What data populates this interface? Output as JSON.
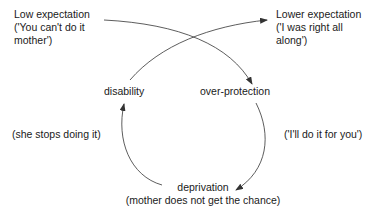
{
  "nodes": {
    "low_expectation": {
      "title": "Low expectation",
      "line2": "('You can't do it",
      "line3": "mother')"
    },
    "lower_expectation": {
      "title": "Lower expectation",
      "line2": "('I was right all",
      "line3": "along')"
    },
    "disability": {
      "label": "disability"
    },
    "over_protection": {
      "label": "over-protection"
    },
    "deprivation": {
      "label": "deprivation",
      "sub": "(mother does not get the chance)"
    }
  },
  "annotations": {
    "left": "(she stops doing it)",
    "right": "('I'll do it for you')"
  },
  "edges": [
    {
      "from": "low_expectation",
      "to": "over_protection"
    },
    {
      "from": "disability",
      "to": "lower_expectation"
    },
    {
      "from": "over_protection",
      "to": "deprivation"
    },
    {
      "from": "deprivation",
      "to": "disability"
    }
  ],
  "colors": {
    "line": "#333333",
    "text": "#1a1a1a"
  }
}
